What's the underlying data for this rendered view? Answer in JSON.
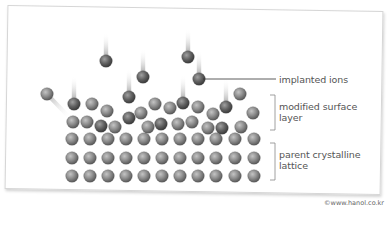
{
  "diagram": {
    "labels": {
      "implanted_ions": "implanted ions",
      "modified_surface_layer": "modified surface layer",
      "parent_crystalline_lattice": "parent crystalline lattice"
    },
    "credit": "©www.hanol.co.kr",
    "colors": {
      "atom": "#8a8a8a",
      "ion": "#5e5e5e",
      "leader_line": "#333333",
      "bracket": "#888888",
      "text": "#555555"
    },
    "lattice": {
      "columns_x": [
        72,
        90,
        108,
        126,
        144,
        162,
        180,
        198,
        216,
        235,
        254
      ],
      "rows_y": [
        139,
        158,
        176
      ]
    },
    "incoming_ions": [
      {
        "x": 106,
        "y": 61
      },
      {
        "x": 143,
        "y": 77
      },
      {
        "x": 188,
        "y": 57
      },
      {
        "x": 199,
        "y": 79
      }
    ],
    "embedded_ions": [
      {
        "x": 74,
        "y": 104
      },
      {
        "x": 129,
        "y": 97
      },
      {
        "x": 183,
        "y": 103
      },
      {
        "x": 226,
        "y": 107
      }
    ],
    "sputtered_atom": {
      "x": 47,
      "y": 94
    },
    "surface_atoms": [
      {
        "x": 92,
        "y": 104
      },
      {
        "x": 107,
        "y": 111
      },
      {
        "x": 141,
        "y": 113
      },
      {
        "x": 155,
        "y": 104
      },
      {
        "x": 170,
        "y": 108
      },
      {
        "x": 198,
        "y": 107
      },
      {
        "x": 213,
        "y": 114
      },
      {
        "x": 240,
        "y": 94
      },
      {
        "x": 253,
        "y": 113
      },
      {
        "x": 73,
        "y": 122
      },
      {
        "x": 87,
        "y": 122
      },
      {
        "x": 115,
        "y": 127
      },
      {
        "x": 148,
        "y": 127
      },
      {
        "x": 178,
        "y": 124
      },
      {
        "x": 192,
        "y": 122
      },
      {
        "x": 208,
        "y": 128
      },
      {
        "x": 241,
        "y": 127
      }
    ],
    "surface_dark_atoms": [
      {
        "x": 101,
        "y": 126
      },
      {
        "x": 129,
        "y": 118
      },
      {
        "x": 161,
        "y": 124
      },
      {
        "x": 222,
        "y": 128
      }
    ]
  }
}
